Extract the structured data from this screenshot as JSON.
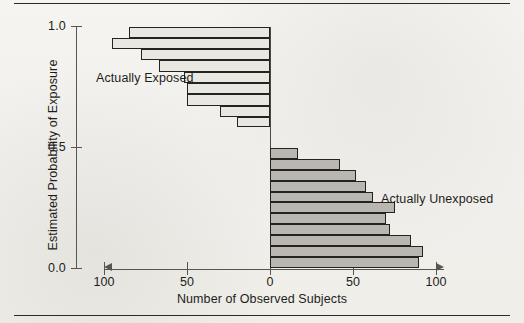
{
  "figure": {
    "background_color": "#f1f0ec",
    "ink_color": "#1d1d1b"
  },
  "axes": {
    "y": {
      "title": "Estimated Probability of Exposure",
      "ticks": [
        "1.0",
        "0.5",
        "0.0"
      ],
      "tick_values": [
        1.0,
        0.5,
        0.0
      ],
      "range": [
        0.0,
        1.0
      ]
    },
    "x": {
      "title": "Number of Observed Subjects",
      "ticks": [
        "100",
        "50",
        "0",
        "50",
        "100"
      ],
      "tick_values": [
        -100,
        -50,
        0,
        50,
        100
      ],
      "range": [
        -110,
        110
      ],
      "left_arrow": "arrow-left",
      "right_arrow": "arrow-right"
    }
  },
  "series_labels": {
    "exposed": "Actually Exposed",
    "unexposed": "Actually Unexposed"
  },
  "colors": {
    "exposed_fill": "#e8e7e1",
    "unexposed_fill": "#b9b7b0",
    "bar_outline": "#232320",
    "axis": "#57564f"
  },
  "chart_data": {
    "type": "bar",
    "orientation": "horizontal",
    "title": "",
    "subtitle": "",
    "xlabel": "Number of Observed Subjects",
    "ylabel": "Estimated Probability of Exposure",
    "xlim": [
      -110,
      110
    ],
    "ylim": [
      0.0,
      1.0
    ],
    "grid": false,
    "legend_position": "in-plot annotations",
    "series": [
      {
        "name": "Actually Exposed",
        "direction": "left",
        "fill": "#e8e7e1",
        "bins": [
          {
            "y_center": 0.978,
            "y_low": 0.955,
            "y_high": 1.0,
            "count": 85
          },
          {
            "y_center": 0.933,
            "y_low": 0.91,
            "y_high": 0.955,
            "count": 95
          },
          {
            "y_center": 0.888,
            "y_low": 0.865,
            "y_high": 0.91,
            "count": 78
          },
          {
            "y_center": 0.838,
            "y_low": 0.815,
            "y_high": 0.865,
            "count": 67
          },
          {
            "y_center": 0.793,
            "y_low": 0.77,
            "y_high": 0.815,
            "count": 52
          },
          {
            "y_center": 0.748,
            "y_low": 0.725,
            "y_high": 0.77,
            "count": 50
          },
          {
            "y_center": 0.698,
            "y_low": 0.675,
            "y_high": 0.725,
            "count": 50
          },
          {
            "y_center": 0.653,
            "y_low": 0.63,
            "y_high": 0.675,
            "count": 30
          },
          {
            "y_center": 0.608,
            "y_low": 0.585,
            "y_high": 0.63,
            "count": 20
          }
        ],
        "values": [
          85,
          95,
          78,
          67,
          52,
          50,
          50,
          30,
          20
        ]
      },
      {
        "name": "Actually Unexposed",
        "direction": "right",
        "fill": "#b9b7b0",
        "bins": [
          {
            "y_center": 0.478,
            "y_low": 0.455,
            "y_high": 0.5,
            "count": 17
          },
          {
            "y_center": 0.433,
            "y_low": 0.41,
            "y_high": 0.455,
            "count": 42
          },
          {
            "y_center": 0.388,
            "y_low": 0.365,
            "y_high": 0.41,
            "count": 52
          },
          {
            "y_center": 0.343,
            "y_low": 0.32,
            "y_high": 0.365,
            "count": 58
          },
          {
            "y_center": 0.298,
            "y_low": 0.275,
            "y_high": 0.32,
            "count": 62
          },
          {
            "y_center": 0.253,
            "y_low": 0.23,
            "y_high": 0.275,
            "count": 75
          },
          {
            "y_center": 0.208,
            "y_low": 0.185,
            "y_high": 0.23,
            "count": 70
          },
          {
            "y_center": 0.163,
            "y_low": 0.14,
            "y_high": 0.185,
            "count": 72
          },
          {
            "y_center": 0.118,
            "y_low": 0.095,
            "y_high": 0.14,
            "count": 85
          },
          {
            "y_center": 0.073,
            "y_low": 0.05,
            "y_high": 0.095,
            "count": 92
          },
          {
            "y_center": 0.028,
            "y_low": 0.005,
            "y_high": 0.05,
            "count": 90
          }
        ],
        "values": [
          17,
          42,
          52,
          58,
          62,
          75,
          70,
          72,
          85,
          92,
          90
        ]
      }
    ]
  }
}
